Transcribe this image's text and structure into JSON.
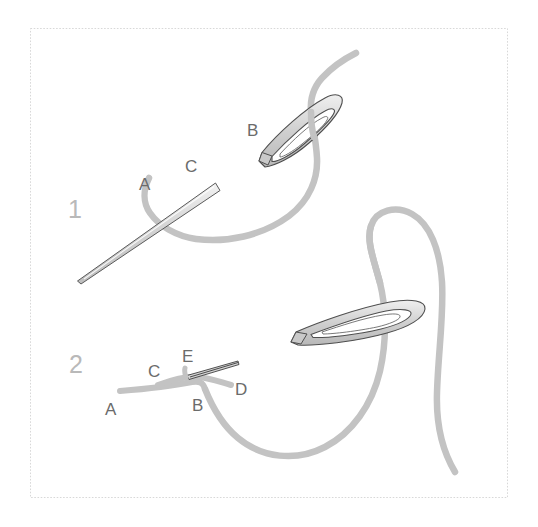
{
  "figure": {
    "title": "Two-step needle and thread stitch instruction diagram",
    "background_color": "#ffffff",
    "frame": {
      "name": "diagram-frame",
      "style": "dotted",
      "color": "#d8d8d8",
      "x": 30,
      "y": 28,
      "width": 478,
      "height": 470
    },
    "colors": {
      "thread": "#c3c3c3",
      "needle_fill": "#cfcfcf",
      "needle_outline": "#555555",
      "label_text": "#6b6b6b",
      "step_number_text": "#b9b9b9",
      "frame": "#d8d8d8",
      "background": "#ffffff"
    },
    "steps": [
      {
        "id": "step-1",
        "number": "1",
        "number_x": 68,
        "number_y": 218,
        "labels": [
          {
            "id": "label-1-a",
            "text": "A",
            "x": 139,
            "y": 190
          },
          {
            "id": "label-1-c",
            "text": "C",
            "x": 185,
            "y": 172
          },
          {
            "id": "label-1-b",
            "text": "B",
            "x": 247,
            "y": 136
          }
        ]
      },
      {
        "id": "step-2",
        "number": "2",
        "number_x": 69,
        "number_y": 373,
        "labels": [
          {
            "id": "label-2-e",
            "text": "E",
            "x": 182,
            "y": 362
          },
          {
            "id": "label-2-c",
            "text": "C",
            "x": 148,
            "y": 377
          },
          {
            "id": "label-2-d",
            "text": "D",
            "x": 235,
            "y": 395
          },
          {
            "id": "label-2-a",
            "text": "A",
            "x": 105,
            "y": 415
          },
          {
            "id": "label-2-b",
            "text": "B",
            "x": 192,
            "y": 411
          }
        ]
      }
    ]
  }
}
